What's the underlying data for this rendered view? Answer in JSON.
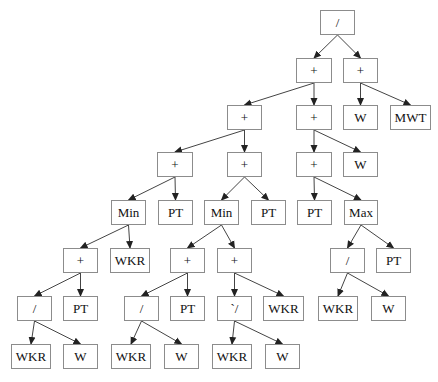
{
  "diagram": {
    "type": "expression-tree",
    "colors": {
      "edge": "#444444",
      "node_border": "#8c8c8c",
      "text": "#111111",
      "background": "#ffffff"
    },
    "nodes": [
      {
        "id": "n0",
        "label": "/",
        "x": 320,
        "y": 10,
        "w": 35
      },
      {
        "id": "n1",
        "label": "+",
        "x": 296,
        "y": 58,
        "w": 36
      },
      {
        "id": "n2",
        "label": "+",
        "x": 343,
        "y": 58,
        "w": 35
      },
      {
        "id": "n3",
        "label": "+",
        "x": 227,
        "y": 105,
        "w": 35
      },
      {
        "id": "n4",
        "label": "+",
        "x": 296,
        "y": 105,
        "w": 36
      },
      {
        "id": "n5",
        "label": "W",
        "x": 343,
        "y": 105,
        "w": 35
      },
      {
        "id": "n6",
        "label": "MWT",
        "x": 390,
        "y": 105,
        "w": 41
      },
      {
        "id": "n7",
        "label": "+",
        "x": 157,
        "y": 152,
        "w": 36
      },
      {
        "id": "n8",
        "label": "+",
        "x": 227,
        "y": 152,
        "w": 35
      },
      {
        "id": "n9",
        "label": "+",
        "x": 296,
        "y": 152,
        "w": 36
      },
      {
        "id": "n10",
        "label": "W",
        "x": 343,
        "y": 152,
        "w": 35
      },
      {
        "id": "n11",
        "label": "Min",
        "x": 111,
        "y": 200,
        "w": 35
      },
      {
        "id": "n12",
        "label": "PT",
        "x": 158,
        "y": 200,
        "w": 35
      },
      {
        "id": "n13",
        "label": "Min",
        "x": 204,
        "y": 200,
        "w": 35
      },
      {
        "id": "n14",
        "label": "PT",
        "x": 251,
        "y": 200,
        "w": 35
      },
      {
        "id": "n15",
        "label": "PT",
        "x": 297,
        "y": 200,
        "w": 35
      },
      {
        "id": "n16",
        "label": "Max",
        "x": 344,
        "y": 200,
        "w": 34
      },
      {
        "id": "n17",
        "label": "+",
        "x": 63,
        "y": 248,
        "w": 35
      },
      {
        "id": "n18",
        "label": "WKR",
        "x": 110,
        "y": 248,
        "w": 40
      },
      {
        "id": "n19",
        "label": "+",
        "x": 170,
        "y": 248,
        "w": 35
      },
      {
        "id": "n20",
        "label": "+",
        "x": 217,
        "y": 248,
        "w": 35
      },
      {
        "id": "n21",
        "label": "/",
        "x": 330,
        "y": 248,
        "w": 35
      },
      {
        "id": "n22",
        "label": "PT",
        "x": 376,
        "y": 248,
        "w": 35
      },
      {
        "id": "n23",
        "label": "/",
        "x": 17,
        "y": 296,
        "w": 35
      },
      {
        "id": "n24",
        "label": "PT",
        "x": 63,
        "y": 296,
        "w": 35
      },
      {
        "id": "n25",
        "label": "/",
        "x": 124,
        "y": 296,
        "w": 35
      },
      {
        "id": "n26",
        "label": "PT",
        "x": 170,
        "y": 296,
        "w": 35
      },
      {
        "id": "n27",
        "label": "`/",
        "x": 217,
        "y": 296,
        "w": 35
      },
      {
        "id": "n28",
        "label": "WKR",
        "x": 263,
        "y": 296,
        "w": 41
      },
      {
        "id": "n29",
        "label": "WKR",
        "x": 318,
        "y": 296,
        "w": 40
      },
      {
        "id": "n30",
        "label": "W",
        "x": 371,
        "y": 296,
        "w": 35
      },
      {
        "id": "n31",
        "label": "WKR",
        "x": 11,
        "y": 344,
        "w": 40
      },
      {
        "id": "n32",
        "label": "W",
        "x": 63,
        "y": 344,
        "w": 35
      },
      {
        "id": "n33",
        "label": "WKR",
        "x": 111,
        "y": 344,
        "w": 40
      },
      {
        "id": "n34",
        "label": "W",
        "x": 164,
        "y": 344,
        "w": 35
      },
      {
        "id": "n35",
        "label": "WKR",
        "x": 212,
        "y": 344,
        "w": 40
      },
      {
        "id": "n36",
        "label": "W",
        "x": 265,
        "y": 344,
        "w": 35
      }
    ],
    "edges": [
      [
        "n0",
        "n1"
      ],
      [
        "n0",
        "n2"
      ],
      [
        "n1",
        "n3"
      ],
      [
        "n1",
        "n4"
      ],
      [
        "n2",
        "n5"
      ],
      [
        "n2",
        "n6"
      ],
      [
        "n3",
        "n7"
      ],
      [
        "n3",
        "n8"
      ],
      [
        "n4",
        "n9"
      ],
      [
        "n4",
        "n10"
      ],
      [
        "n7",
        "n11"
      ],
      [
        "n7",
        "n12"
      ],
      [
        "n8",
        "n13"
      ],
      [
        "n8",
        "n14"
      ],
      [
        "n9",
        "n15"
      ],
      [
        "n9",
        "n16"
      ],
      [
        "n11",
        "n17"
      ],
      [
        "n11",
        "n18"
      ],
      [
        "n13",
        "n19"
      ],
      [
        "n13",
        "n20"
      ],
      [
        "n16",
        "n21"
      ],
      [
        "n16",
        "n22"
      ],
      [
        "n17",
        "n23"
      ],
      [
        "n17",
        "n24"
      ],
      [
        "n19",
        "n25"
      ],
      [
        "n19",
        "n26"
      ],
      [
        "n20",
        "n27"
      ],
      [
        "n20",
        "n28"
      ],
      [
        "n21",
        "n29"
      ],
      [
        "n21",
        "n30"
      ],
      [
        "n23",
        "n31"
      ],
      [
        "n23",
        "n32"
      ],
      [
        "n25",
        "n33"
      ],
      [
        "n25",
        "n34"
      ],
      [
        "n27",
        "n35"
      ],
      [
        "n27",
        "n36"
      ]
    ]
  }
}
